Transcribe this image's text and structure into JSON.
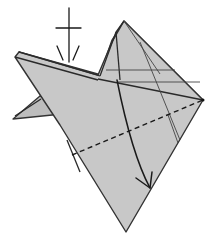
{
  "diagram": {
    "title": "",
    "colors": {
      "paper": "#c8c8c8",
      "outline": "#333333",
      "background": "#ffffff"
    },
    "symbols": [
      {
        "name": "turn-over-or-push-in-symbol",
        "kind": "cross-with-arrowhead",
        "position": [
          68,
          35
        ]
      },
      {
        "name": "valley-fold-line",
        "kind": "dashed-line",
        "from": [
          72,
          155
        ],
        "to": [
          203,
          100
        ]
      },
      {
        "name": "fold-direction-arrow",
        "kind": "curved-arrow",
        "from": [
          117,
          80
        ],
        "to": [
          148,
          188
        ]
      }
    ],
    "vertices": {
      "top_peak": [
        124,
        21
      ],
      "right_point": [
        203,
        100
      ],
      "bottom_point": [
        126,
        232
      ],
      "left_corner": [
        17,
        55
      ],
      "small_flap_tip": [
        13,
        119
      ]
    }
  }
}
